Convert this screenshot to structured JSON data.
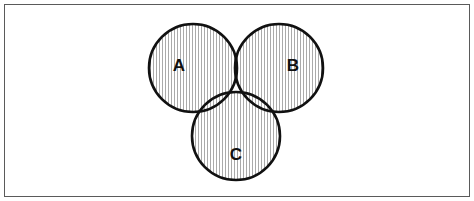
{
  "figure": {
    "kind": "venn-diagram",
    "title": "",
    "caption": "",
    "background_color": "#ffffff",
    "frame": {
      "visible": true,
      "color": "#5a5a5a",
      "width_px": 1.6
    }
  },
  "chart_data": {
    "type": "diagram",
    "diagram_type": "venn-3-set",
    "title": "",
    "xlabel": "",
    "ylabel": "",
    "legend": [],
    "sets": [
      {
        "id": "A",
        "label": "A",
        "cx": 193,
        "cy": 68,
        "r": 44,
        "label_x": 179,
        "label_y": 67,
        "stroke": "#111111",
        "stroke_width": 2.6,
        "fill": "hatch-vertical"
      },
      {
        "id": "B",
        "label": "B",
        "cx": 279,
        "cy": 68,
        "r": 44,
        "label_x": 293,
        "label_y": 67,
        "stroke": "#111111",
        "stroke_width": 2.6,
        "fill": "hatch-vertical"
      },
      {
        "id": "C",
        "label": "C",
        "cx": 236,
        "cy": 136,
        "r": 44,
        "label_x": 236,
        "label_y": 156,
        "stroke": "#111111",
        "stroke_width": 2.6,
        "fill": "hatch-vertical"
      }
    ],
    "shaded_region": {
      "expression": "A ∪ B ∪ C",
      "description": "The entire union of all three sets is shaded with vertical hatch lines.",
      "pattern": "vertical-lines",
      "pattern_spacing_px": 3,
      "pattern_line_width_px": 0.9,
      "pattern_color": "#9a9a9a"
    },
    "regions": [
      {
        "id": "A-only",
        "expression": "A ∩ B' ∩ C'",
        "shaded": true
      },
      {
        "id": "B-only",
        "expression": "A' ∩ B ∩ C'",
        "shaded": true
      },
      {
        "id": "C-only",
        "expression": "A' ∩ B' ∩ C",
        "shaded": true
      },
      {
        "id": "AB",
        "expression": "A ∩ B ∩ C'",
        "shaded": true
      },
      {
        "id": "AC",
        "expression": "A ∩ B' ∩ C",
        "shaded": true
      },
      {
        "id": "BC",
        "expression": "A' ∩ B ∩ C",
        "shaded": true
      },
      {
        "id": "ABC",
        "expression": "A ∩ B ∩ C",
        "shaded": true
      },
      {
        "id": "outside",
        "expression": "(A ∪ B ∪ C)'",
        "shaded": false
      }
    ],
    "colors": {
      "stroke": "#111111",
      "hatch": "#9a9a9a",
      "background": "#ffffff",
      "frame": "#5a5a5a",
      "label": "#111111"
    }
  }
}
